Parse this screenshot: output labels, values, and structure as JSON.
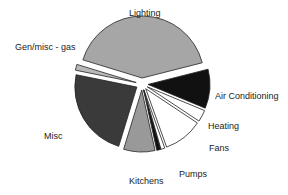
{
  "chart_data": {
    "type": "pie",
    "title": "",
    "exploded": true,
    "slices": [
      {
        "label": "Lighting",
        "value": 40.5,
        "color": "#a6a6a6"
      },
      {
        "label": "Air Conditioning",
        "value": 10.0,
        "color": "#111111"
      },
      {
        "label": "Heating",
        "value": 3.0,
        "color": "#ffffff"
      },
      {
        "label": "Fans",
        "value": 10.0,
        "color": "#ffffff"
      },
      {
        "label": "",
        "value": 1.0,
        "color": "#ffffff"
      },
      {
        "label": "Pumps",
        "value": 1.0,
        "color": "#111111"
      },
      {
        "label": "Kitchens",
        "value": 8.0,
        "color": "#999999"
      },
      {
        "label": "Misc",
        "value": 23.0,
        "color": "#3a3a3a"
      },
      {
        "label": "Gen/misc - gas",
        "value": 1.5,
        "color": "#b8b8b8"
      }
    ],
    "start_angle_deg": 197,
    "direction": "clockwise",
    "legend": "none (inline labels)"
  },
  "labels": {
    "lighting": "Lighting",
    "gen_misc_gas": "Gen/misc - gas",
    "air_conditioning": "Air Conditioning",
    "heating": "Heating",
    "fans": "Fans",
    "pumps": "Pumps",
    "kitchens": "Kitchens",
    "misc": "Misc"
  }
}
